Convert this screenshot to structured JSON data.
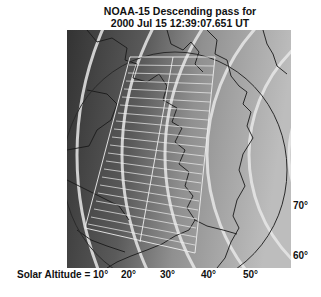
{
  "title": {
    "line1": "NOAA-15 Descending pass for",
    "line2": "2000 Jul 15  12:39:07.651  UT"
  },
  "map": {
    "region": "North America / North Atlantic",
    "colors": {
      "night": "#3a3a3a",
      "day": "#b4b4b4",
      "contour": "#e6e6e6",
      "swath": "#eeeeee",
      "coast": "#1a1a1a",
      "horizon_circle": "#2a2a2a"
    }
  },
  "solar_altitude_labels": {
    "prefix": "Solar Altitude = ",
    "bottom": [
      "10°",
      "20°",
      "30°",
      "40°",
      "50°"
    ],
    "right": [
      "70°",
      "60°"
    ]
  }
}
